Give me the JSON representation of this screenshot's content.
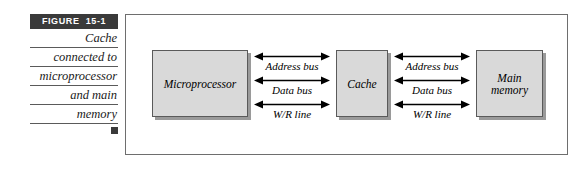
{
  "figure": {
    "tag_label": "FIGURE  15-1",
    "caption_lines": [
      "Cache",
      "connected to",
      "microprocessor",
      "and main",
      "memory"
    ],
    "end_marker": "square-marker"
  },
  "diagram": {
    "nodes": [
      {
        "id": "microprocessor",
        "lines": [
          "Microprocessor"
        ]
      },
      {
        "id": "cache",
        "lines": [
          "Cache"
        ]
      },
      {
        "id": "main-memory",
        "lines": [
          "Main",
          "memory"
        ]
      }
    ],
    "bus_groups": [
      {
        "id": "microprocessor-to-cache",
        "lines": [
          {
            "label": "Address bus",
            "direction": "bidirectional"
          },
          {
            "label": "Data bus",
            "direction": "bidirectional"
          },
          {
            "label": "W/R line",
            "direction": "bidirectional"
          }
        ]
      },
      {
        "id": "cache-to-main-memory",
        "lines": [
          {
            "label": "Address bus",
            "direction": "bidirectional"
          },
          {
            "label": "Data bus",
            "direction": "bidirectional"
          },
          {
            "label": "W/R line",
            "direction": "bidirectional"
          }
        ]
      }
    ]
  },
  "colors": {
    "tag_background": "#3a3a3a",
    "tag_text": "#ffffff",
    "node_fill": "#d9d9d9",
    "node_border": "#5a5a5a",
    "node_shadow": "#9a9a9a",
    "frame_border": "#6e6e6e",
    "rule_line": "#5a5a5a",
    "text": "#000000",
    "page_background": "#ffffff"
  }
}
